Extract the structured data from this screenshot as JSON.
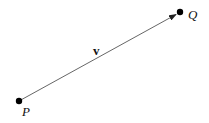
{
  "diagram": {
    "points": [
      {
        "label": "P",
        "x": 19,
        "y": 101
      },
      {
        "label": "Q",
        "x": 180,
        "y": 12
      }
    ],
    "vector": {
      "label": "v",
      "from": "P",
      "to": "Q"
    },
    "colors": {
      "line": "#555555",
      "point": "#000000",
      "text": "#111111"
    }
  }
}
